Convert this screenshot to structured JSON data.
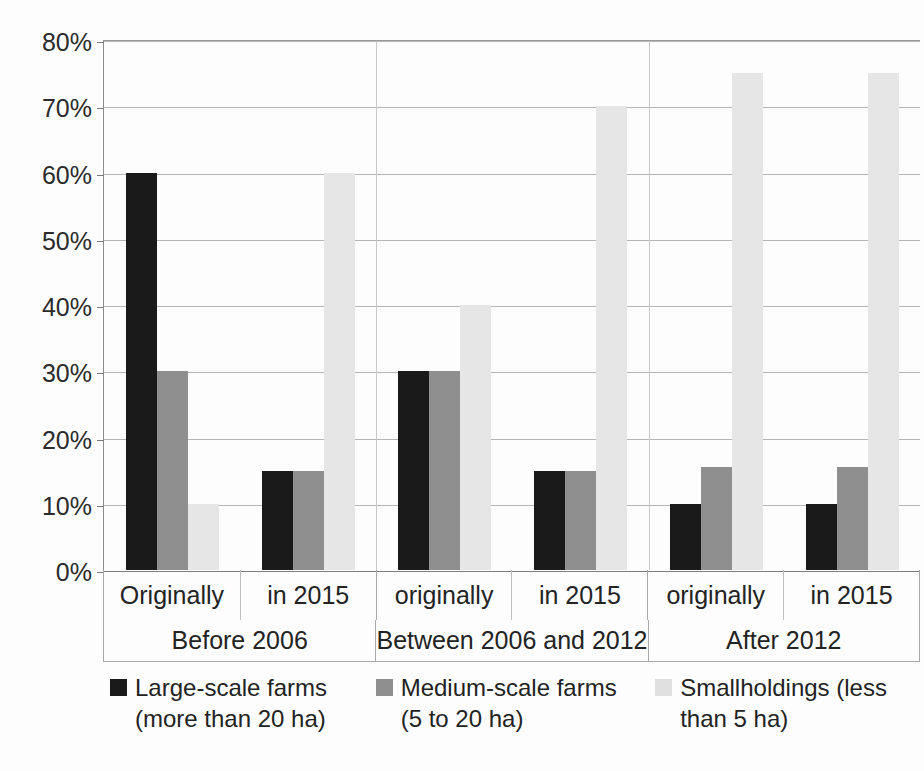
{
  "chart_data": {
    "type": "bar",
    "title": "",
    "subtitle": "",
    "xlabel": "",
    "ylabel": "",
    "ylim": [
      0,
      80
    ],
    "y_tick_labels": [
      "0%",
      "10%",
      "20%",
      "30%",
      "40%",
      "50%",
      "60%",
      "70%",
      "80%"
    ],
    "y_tick_values": [
      0,
      10,
      20,
      30,
      40,
      50,
      60,
      70,
      80
    ],
    "grid": true,
    "legend_position": "bottom",
    "value_unit": "%",
    "categories": [
      "Originally",
      "in 2015",
      "originally",
      "in 2015",
      "originally",
      "in 2015"
    ],
    "groups": [
      {
        "label": "Before 2006",
        "subcategories": [
          "Originally",
          "in 2015"
        ]
      },
      {
        "label": "Between 2006 and 2012",
        "subcategories": [
          "originally",
          "in 2015"
        ]
      },
      {
        "label": "After 2012",
        "subcategories": [
          "originally",
          "in 2015"
        ]
      }
    ],
    "series": [
      {
        "name": "Large-scale farms (more than 20 ha)",
        "name_line1": "Large-scale farms",
        "name_line2": "(more than 20 ha)",
        "color": "#1a1a1a",
        "values": [
          60,
          15,
          30,
          15,
          10,
          10
        ]
      },
      {
        "name": "Medium-scale farms (5 to 20 ha)",
        "name_line1": "Medium-scale farms",
        "name_line2": "(5 to 20 ha)",
        "color": "#8f8f8f",
        "values": [
          30,
          15,
          30,
          15,
          15.5,
          15.5
        ]
      },
      {
        "name": "Smallholdings (less than 5 ha)",
        "name_line1": "Smallholdings (less",
        "name_line2": "than 5 ha)",
        "color": "#e6e6e6",
        "values": [
          10,
          60,
          40,
          70,
          75,
          75
        ]
      }
    ]
  },
  "axis": {
    "y_ticks": [
      {
        "label": "80%",
        "value": 80
      },
      {
        "label": "70%",
        "value": 70
      },
      {
        "label": "60%",
        "value": 60
      },
      {
        "label": "50%",
        "value": 50
      },
      {
        "label": "40%",
        "value": 40
      },
      {
        "label": "30%",
        "value": 30
      },
      {
        "label": "20%",
        "value": 20
      },
      {
        "label": "10%",
        "value": 10
      },
      {
        "label": "0%",
        "value": 0
      }
    ],
    "sub_labels": [
      "Originally",
      "in 2015",
      "originally",
      "in 2015",
      "originally",
      "in 2015"
    ],
    "group_labels": [
      "Before 2006",
      "Between 2006 and 2012",
      "After 2012"
    ]
  },
  "legend": {
    "items": [
      {
        "label_line1": "Large-scale farms",
        "label_line2": "(more than 20 ha)",
        "color": "#1a1a1a"
      },
      {
        "label_line1": "Medium-scale farms",
        "label_line2": "(5 to 20 ha)",
        "color": "#8f8f8f"
      },
      {
        "label_line1": "Smallholdings (less",
        "label_line2": "than 5 ha)",
        "color": "#e0e0e0"
      }
    ]
  },
  "colors": {
    "large_scale": "#1a1a1a",
    "medium_scale": "#8f8f8f",
    "smallholdings": "#e6e6e6",
    "gridline": "#b5b5b5",
    "axis": "#8c8c8c",
    "background": "#fdfdfd",
    "text": "#232323"
  }
}
